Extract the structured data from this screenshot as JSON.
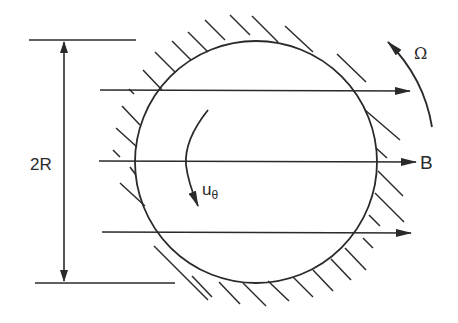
{
  "diagram": {
    "colors": {
      "ink": "#2a2a2a",
      "background": "#ffffff"
    },
    "labels": {
      "diameter": "2R",
      "field": "B",
      "rotation": "Ω",
      "velocity_main": "u",
      "velocity_sub": "θ"
    },
    "cylinder": {
      "cx": 256,
      "cy": 162,
      "r": 121
    },
    "field_lines": [
      {
        "y": 90,
        "x1": 100,
        "x2": 410
      },
      {
        "y": 161,
        "x1": 99,
        "x2": 416
      },
      {
        "y": 232,
        "x1": 102,
        "x2": 411
      }
    ],
    "dimension": {
      "x": 64,
      "y_top": 40,
      "y_bottom": 284
    }
  }
}
